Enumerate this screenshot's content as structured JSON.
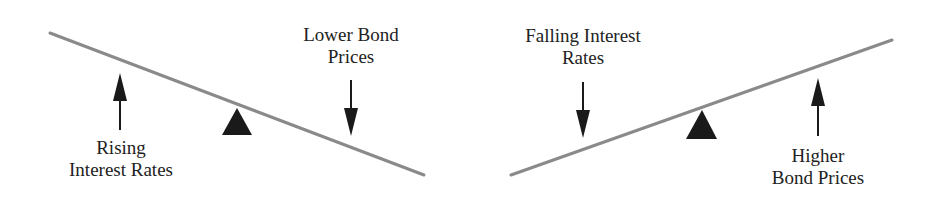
{
  "diagram": {
    "type": "seesaw-comparison",
    "colors": {
      "beam": "#8a8a8a",
      "fulcrum": "#1a1a1a",
      "arrow": "#1a1a1a",
      "text": "#222222",
      "background": "#ffffff"
    },
    "panels": [
      {
        "id": "left",
        "beam": {
          "x1": 50,
          "y1": 33,
          "x2": 424,
          "y2": 175,
          "tilt": "down-right"
        },
        "fulcrum": {
          "points": "222,135 237,108 252,135"
        },
        "arrows": [
          {
            "id": "rising-rates-arrow",
            "direction": "up",
            "x": 120,
            "y_tail": 130,
            "y_head": 73
          },
          {
            "id": "lower-prices-arrow",
            "direction": "down",
            "x": 351,
            "y_tail": 80,
            "y_head": 136
          }
        ],
        "labels": [
          {
            "id": "rising-interest-rates",
            "lines": [
              "Rising",
              "Interest Rates"
            ]
          },
          {
            "id": "lower-bond-prices",
            "lines": [
              "Lower Bond",
              "Prices"
            ]
          }
        ]
      },
      {
        "id": "right",
        "beam": {
          "x1": 511,
          "y1": 175,
          "x2": 892,
          "y2": 40,
          "tilt": "up-right"
        },
        "fulcrum": {
          "points": "686,139 702,110 717,139"
        },
        "arrows": [
          {
            "id": "falling-rates-arrow",
            "direction": "down",
            "x": 583,
            "y_tail": 82,
            "y_head": 138
          },
          {
            "id": "higher-prices-arrow",
            "direction": "up",
            "x": 818,
            "y_tail": 136,
            "y_head": 78
          }
        ],
        "labels": [
          {
            "id": "falling-interest-rates",
            "lines": [
              "Falling Interest",
              "Rates"
            ]
          },
          {
            "id": "higher-bond-prices",
            "lines": [
              "Higher",
              "Bond Prices"
            ]
          }
        ]
      }
    ]
  },
  "text": {
    "rising_line1": "Rising",
    "rising_line2": "Interest Rates",
    "lower_line1": "Lower Bond",
    "lower_line2": "Prices",
    "falling_line1": "Falling Interest",
    "falling_line2": "Rates",
    "higher_line1": "Higher",
    "higher_line2": "Bond Prices"
  }
}
